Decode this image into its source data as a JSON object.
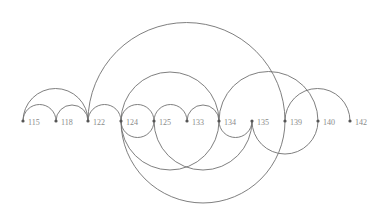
{
  "diagram": {
    "type": "arc-diagram",
    "baseline_y": 121,
    "nodes": [
      {
        "id": "115",
        "label": "115",
        "x": 23
      },
      {
        "id": "118",
        "label": "118",
        "x": 56
      },
      {
        "id": "122",
        "label": "122",
        "x": 88
      },
      {
        "id": "124",
        "label": "124",
        "x": 121
      },
      {
        "id": "125",
        "label": "125",
        "x": 154
      },
      {
        "id": "133",
        "label": "133",
        "x": 187
      },
      {
        "id": "134",
        "label": "134",
        "x": 219
      },
      {
        "id": "135",
        "label": "135",
        "x": 252
      },
      {
        "id": "139",
        "label": "139",
        "x": 285
      },
      {
        "id": "140",
        "label": "140",
        "x": 318
      },
      {
        "id": "142",
        "label": "142",
        "x": 350
      }
    ],
    "edges": [
      {
        "source": "115",
        "target": "118",
        "side": "above"
      },
      {
        "source": "118",
        "target": "122",
        "side": "above"
      },
      {
        "source": "115",
        "target": "122",
        "side": "above"
      },
      {
        "source": "122",
        "target": "124",
        "side": "above"
      },
      {
        "source": "122",
        "target": "139",
        "side": "above"
      },
      {
        "source": "124",
        "target": "125",
        "side": "above"
      },
      {
        "source": "125",
        "target": "133",
        "side": "above"
      },
      {
        "source": "133",
        "target": "134",
        "side": "above"
      },
      {
        "source": "124",
        "target": "134",
        "side": "above"
      },
      {
        "source": "134",
        "target": "140",
        "side": "above"
      },
      {
        "source": "139",
        "target": "142",
        "side": "above"
      },
      {
        "source": "124",
        "target": "125",
        "side": "below"
      },
      {
        "source": "134",
        "target": "135",
        "side": "below"
      },
      {
        "source": "124",
        "target": "134",
        "side": "below"
      },
      {
        "source": "125",
        "target": "135",
        "side": "below"
      },
      {
        "source": "124",
        "target": "139",
        "side": "below"
      },
      {
        "source": "135",
        "target": "140",
        "side": "below"
      }
    ]
  }
}
